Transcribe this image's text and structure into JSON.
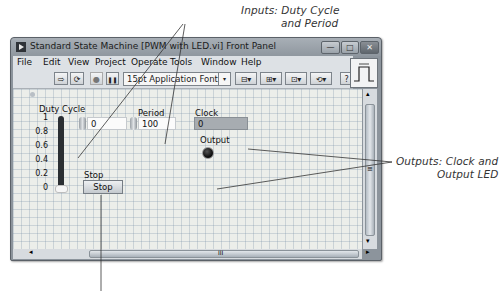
{
  "annotations": {
    "inputs_line1": "Inputs: Duty Cycle",
    "inputs_line2": "and Period",
    "outputs_line1": "Outputs: Clock and",
    "outputs_line2": "Output LED"
  },
  "window": {
    "title": "Standard State Machine [PWM with LED.vi] Front Panel",
    "controls": {
      "minimize": "—",
      "maximize": "□",
      "close": "✕"
    }
  },
  "menu": {
    "items": [
      {
        "label": "File",
        "accel": "F"
      },
      {
        "label": "Edit",
        "accel": "E"
      },
      {
        "label": "View",
        "accel": "V"
      },
      {
        "label": "Project",
        "accel": "P"
      },
      {
        "label": "Operate",
        "accel": "O"
      },
      {
        "label": "Tools",
        "accel": "T"
      },
      {
        "label": "Window",
        "accel": "W"
      },
      {
        "label": "Help",
        "accel": "H"
      }
    ]
  },
  "toolbar": {
    "run_icon": "⇨",
    "run_continuously_icon": "⟳",
    "abort_icon": "●",
    "pause_icon": "❚❚",
    "font_select": "15pt Application Font",
    "font_dropdown_icon": "▾",
    "align_icon": "⊟▾",
    "distribute_icon": "⊞▾",
    "resize_icon": "⊡▾",
    "reorder_icon": "⟲▾",
    "help_icon": "?"
  },
  "front_panel": {
    "duty_cycle": {
      "label": "Duty Cycle",
      "value": "0",
      "scale": [
        "1",
        "0.8",
        "0.6",
        "0.4",
        "0.2",
        "0"
      ]
    },
    "period": {
      "label": "Period",
      "value": "100"
    },
    "clock": {
      "label": "Clock",
      "value": "0"
    },
    "output": {
      "label": "Output",
      "state": "off"
    },
    "stop": {
      "label": "Stop",
      "button_text": "Stop"
    }
  },
  "scrollbars": {
    "vertical_up": "▴",
    "vertical_down": "▾",
    "vertical_grip": "≡",
    "horizontal_left": "◂",
    "horizontal_right": "▸",
    "horizontal_grip": "III"
  }
}
